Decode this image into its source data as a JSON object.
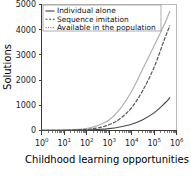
{
  "chart_data": {
    "type": "line",
    "title": "",
    "xlabel": "Childhood learning opportunities",
    "ylabel": "Solutions",
    "xscale": "log",
    "yscale": "linear",
    "xlim": [
      1,
      1000000
    ],
    "ylim": [
      0,
      5000
    ],
    "grid": false,
    "legend_position": "top-left-inside",
    "y_ticks": [
      0,
      1000,
      2000,
      3000,
      4000,
      5000
    ],
    "y_tick_labels": [
      "0",
      "1000",
      "2000",
      "3000",
      "4000",
      "5000"
    ],
    "x_ticks": [
      1,
      10,
      100,
      1000,
      10000,
      100000,
      1000000
    ],
    "x_tick_labels": [
      "10",
      "10",
      "10",
      "10",
      "10",
      "10",
      "10"
    ],
    "x_tick_exponents": [
      "0",
      "1",
      "2",
      "3",
      "4",
      "5",
      "6"
    ],
    "series": [
      {
        "name": "Individual alone",
        "style": "solid",
        "color": "#4a4a4a",
        "x": [
          1,
          10,
          100,
          300,
          1000,
          3000,
          10000,
          30000,
          100000,
          300000,
          500000
        ],
        "y": [
          2,
          6,
          20,
          40,
          75,
          140,
          250,
          420,
          700,
          1080,
          1300
        ]
      },
      {
        "name": "Sequence imitation",
        "style": "dashed",
        "color": "#555555",
        "x": [
          1,
          10,
          100,
          300,
          1000,
          3000,
          10000,
          30000,
          100000,
          300000,
          500000
        ],
        "y": [
          3,
          10,
          45,
          100,
          230,
          460,
          900,
          1550,
          2500,
          3650,
          4150
        ]
      },
      {
        "name": "Available in the population",
        "style": "fine-dashed",
        "color": "#b0b0b0",
        "x": [
          1,
          10,
          100,
          300,
          1000,
          3000,
          10000,
          30000,
          100000,
          300000,
          500000
        ],
        "y": [
          5,
          18,
          80,
          190,
          420,
          840,
          1550,
          2400,
          3350,
          4250,
          4720
        ]
      }
    ]
  },
  "legend": {
    "items": [
      {
        "label": "Individual alone"
      },
      {
        "label": "Sequence imitation"
      },
      {
        "label": "Available in the population"
      }
    ]
  },
  "axes": {
    "x_title": "Childhood learning opportunities",
    "y_title": "Solutions"
  }
}
